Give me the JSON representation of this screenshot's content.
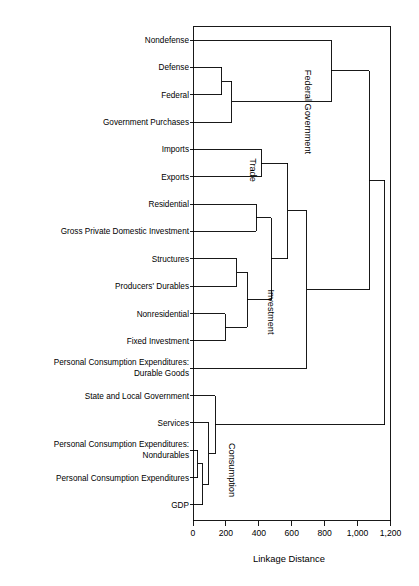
{
  "chart_data": {
    "type": "dendrogram",
    "title": "",
    "xlabel": "Linkage Distance",
    "ylabel": "",
    "xlim": [
      0,
      1200
    ],
    "xticks": [
      0,
      200,
      400,
      600,
      800,
      1000,
      1200
    ],
    "xtick_labels": [
      "0",
      "200",
      "400",
      "600",
      "800",
      "1,000",
      "1,200"
    ],
    "grid": false,
    "orientation": "horizontal-left-to-right",
    "leaves": [
      {
        "label": "Nondefense",
        "order": 0
      },
      {
        "label": "Defense",
        "order": 1
      },
      {
        "label": "Federal",
        "order": 2
      },
      {
        "label": "Government Purchases",
        "order": 3
      },
      {
        "label": "Imports",
        "order": 4
      },
      {
        "label": "Exports",
        "order": 5
      },
      {
        "label": "Residential",
        "order": 6
      },
      {
        "label": "Gross Private Domestic Investment",
        "order": 7
      },
      {
        "label": "Structures",
        "order": 8
      },
      {
        "label": "Producers' Durables",
        "order": 9
      },
      {
        "label": "Nonresidential",
        "order": 10
      },
      {
        "label": "Fixed Investment",
        "order": 11
      },
      {
        "label": "Personal Consumption Expenditures:\nDurable Goods",
        "order": 12
      },
      {
        "label": "State and Local Government",
        "order": 13
      },
      {
        "label": "Services",
        "order": 14
      },
      {
        "label": "Personal Consumption Expenditures:\nNondurables",
        "order": 15
      },
      {
        "label": "Personal Consumption Expenditures",
        "order": 16
      },
      {
        "label": "GDP",
        "order": 17
      }
    ],
    "cluster_labels": [
      {
        "text": "Federal Government",
        "distance": 840,
        "rotated": true
      },
      {
        "text": "Trade",
        "distance": 415,
        "rotated": true
      },
      {
        "text": "Investment",
        "distance": 480,
        "rotated": true
      },
      {
        "text": "Consumption",
        "distance": 230,
        "rotated": true
      }
    ],
    "merges": [
      {
        "id": "m1",
        "left": "Defense",
        "right": "Federal",
        "distance": 175
      },
      {
        "id": "m2",
        "left": "m1",
        "right": "Government Purchases",
        "distance": 235
      },
      {
        "id": "m3",
        "left": "Nondefense",
        "right": "m2",
        "distance": 840
      },
      {
        "id": "m4",
        "left": "Imports",
        "right": "Exports",
        "distance": 415
      },
      {
        "id": "m5",
        "left": "Residential",
        "right": "Gross Private Domestic Investment",
        "distance": 385
      },
      {
        "id": "m6",
        "left": "Structures",
        "right": "Producers' Durables",
        "distance": 265
      },
      {
        "id": "m7",
        "left": "Nonresidential",
        "right": "Fixed Investment",
        "distance": 195
      },
      {
        "id": "m8",
        "left": "m6",
        "right": "m7",
        "distance": 330
      },
      {
        "id": "m9",
        "left": "m5",
        "right": "m8",
        "distance": 475
      },
      {
        "id": "m10",
        "left": "m4",
        "right": "m9",
        "distance": 575
      },
      {
        "id": "m11",
        "left": "m10",
        "right": "Personal Consumption Expenditures: Durable Goods",
        "distance": 690
      },
      {
        "id": "m12",
        "left": "m3",
        "right": "m11",
        "distance": 1070
      },
      {
        "id": "m13",
        "left": "Services",
        "right": "m15",
        "distance": 95
      },
      {
        "id": "m14",
        "left": "Personal Consumption Expenditures: Nondurables",
        "right": "Personal Consumption Expenditures",
        "distance": 30
      },
      {
        "id": "m15",
        "left": "m14",
        "right": "GDP",
        "distance": 60
      },
      {
        "id": "m16",
        "left": "State and Local Government",
        "right": "m13",
        "distance": 135
      },
      {
        "id": "m17",
        "left": "m12",
        "right": "m16",
        "distance": 1165
      }
    ]
  },
  "axis": {
    "title": "Linkage Distance",
    "tick_labels": [
      "0",
      "200",
      "400",
      "600",
      "800",
      "1,000",
      "1,200"
    ]
  },
  "labels": {
    "nondefense": "Nondefense",
    "defense": "Defense",
    "federal": "Federal",
    "government_purchases": "Government Purchases",
    "imports": "Imports",
    "exports": "Exports",
    "residential": "Residential",
    "gpdi": "Gross Private Domestic Investment",
    "structures": "Structures",
    "producers_durables": "Producers' Durables",
    "nonresidential": "Nonresidential",
    "fixed_investment": "Fixed Investment",
    "pce_durable_1": "Personal Consumption Expenditures:",
    "pce_durable_2": "Durable Goods",
    "state_local": "State and Local Government",
    "services": "Services",
    "pce_nondur_1": "Personal Consumption Expenditures:",
    "pce_nondur_2": "Nondurables",
    "pce": "Personal Consumption Expenditures",
    "gdp": "GDP"
  },
  "clusters": {
    "federal_government": "Federal Government",
    "trade": "Trade",
    "investment": "Investment",
    "consumption": "Consumption"
  },
  "colors": {
    "line": "#000000",
    "background": "#ffffff",
    "text": "#000000"
  }
}
